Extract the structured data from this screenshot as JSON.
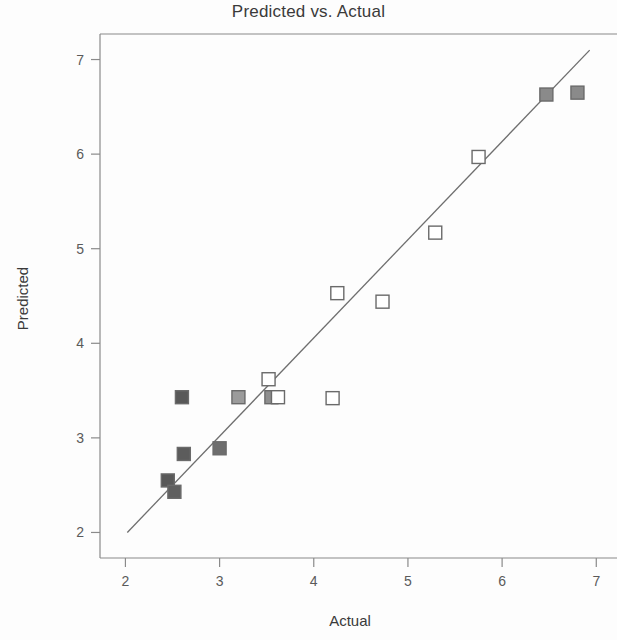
{
  "chart_data": {
    "type": "scatter",
    "title": "Predicted vs. Actual",
    "xlabel": "Actual",
    "ylabel": "Predicted",
    "xlim": [
      1.73,
      7.22
    ],
    "ylim": [
      1.73,
      7.27
    ],
    "xticks": [
      2,
      3,
      4,
      5,
      6,
      7
    ],
    "yticks": [
      2,
      3,
      4,
      5,
      6,
      7
    ],
    "xtick_labels": [
      "2",
      "3",
      "4",
      "5",
      "6",
      "7"
    ],
    "ytick_labels": [
      "2",
      "3",
      "4",
      "5",
      "6",
      "7"
    ],
    "grid": false,
    "legend": null,
    "reference_line": {
      "name": "identity-fit-line",
      "x0": 2.02,
      "y0": 2.0,
      "x1": 6.93,
      "y1": 7.1,
      "color": "#6e6e6e"
    },
    "series": [
      {
        "name": "Observations",
        "marker": "square",
        "points": [
          {
            "x": 2.45,
            "y": 2.55,
            "fill": "#595959"
          },
          {
            "x": 2.52,
            "y": 2.43,
            "fill": "#5f5f5f"
          },
          {
            "x": 2.6,
            "y": 3.43,
            "fill": "#585858"
          },
          {
            "x": 2.62,
            "y": 2.83,
            "fill": "#5c5c5c"
          },
          {
            "x": 3.0,
            "y": 2.89,
            "fill": "#6d6d6d"
          },
          {
            "x": 3.2,
            "y": 3.43,
            "fill": "#9b9b9b"
          },
          {
            "x": 3.55,
            "y": 3.43,
            "fill": "#8e8e8e"
          },
          {
            "x": 3.52,
            "y": 3.62,
            "fill": "#ffffff"
          },
          {
            "x": 3.62,
            "y": 3.43,
            "fill": "#ffffff"
          },
          {
            "x": 4.2,
            "y": 3.42,
            "fill": "#ffffff"
          },
          {
            "x": 4.25,
            "y": 4.53,
            "fill": "#ffffff"
          },
          {
            "x": 4.73,
            "y": 4.44,
            "fill": "#ffffff"
          },
          {
            "x": 5.29,
            "y": 5.17,
            "fill": "#ffffff"
          },
          {
            "x": 5.75,
            "y": 5.97,
            "fill": "#ffffff"
          },
          {
            "x": 6.47,
            "y": 6.63,
            "fill": "#8a8a8a"
          },
          {
            "x": 6.8,
            "y": 6.65,
            "fill": "#8a8a8a"
          }
        ]
      }
    ]
  },
  "colors": {
    "axis": "#8a8a8a",
    "text": "#3a3a3a",
    "tick_text": "#5a5a5a",
    "line": "#6e6e6e",
    "marker_edge": "#6a6a6a",
    "background": "#fdfdfd"
  }
}
